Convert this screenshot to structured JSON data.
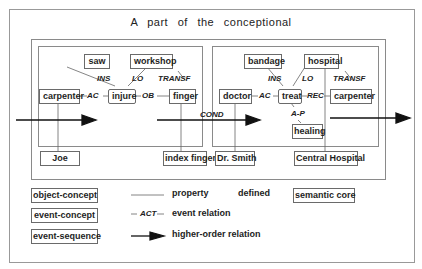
{
  "title": "A part of the conceptional",
  "left_event": {
    "nodes": {
      "saw": "saw",
      "workshop": "workshop",
      "carpenter": "carpenter",
      "injure": "injure",
      "finger": "finger"
    },
    "relations": {
      "ins": "INS",
      "lo": "LO",
      "transf": "TRANSF",
      "ac": "AC",
      "ob": "OB"
    },
    "properties": {
      "joe": "Joe",
      "index_finger": "index finger"
    }
  },
  "higher_order_label": "COND",
  "right_event": {
    "nodes": {
      "bandage": "bandage",
      "hospital": "hospital",
      "doctor": "doctor",
      "treat": "treat",
      "carpenter": "carpenter",
      "healing": "healing"
    },
    "relations": {
      "ins": "INS",
      "lo": "LO",
      "transf": "TRANSF",
      "ac": "AC",
      "rec": "REC",
      "ap": "A-P"
    },
    "properties": {
      "dr_smith": "Dr. Smith",
      "central_hospital": "Central Hospital"
    }
  },
  "legend": {
    "object_concept": "object-concept",
    "event_concept": "event-concept",
    "event_sequence": "event-sequence",
    "property": "property",
    "defined": "defined",
    "semantic_core": "semantic core",
    "act_label": "ACT",
    "event_relation": "event relation",
    "higher_order_relation": "higher-order relation"
  },
  "colors": {
    "line": "#5a5a5a",
    "frame": "#8a8a8a",
    "arrow": "#111111"
  }
}
